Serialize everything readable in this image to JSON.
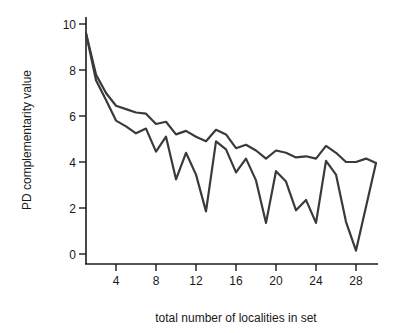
{
  "chart_data": {
    "type": "line",
    "title": "",
    "xlabel": "total number of localities in set",
    "ylabel": "PD complementarity value",
    "xlim": [
      0,
      30
    ],
    "ylim": [
      0,
      10
    ],
    "x_ticks": [
      4,
      8,
      12,
      16,
      20,
      24,
      28
    ],
    "y_ticks": [
      0,
      2,
      4,
      6,
      8,
      10
    ],
    "grid": false,
    "legend": null,
    "x": [
      1,
      2,
      3,
      4,
      5,
      6,
      7,
      8,
      9,
      10,
      11,
      12,
      13,
      14,
      15,
      16,
      17,
      18,
      19,
      20,
      21,
      22,
      23,
      24,
      25,
      26,
      27,
      28,
      29,
      30
    ],
    "series": [
      {
        "name": "upper",
        "color": "#3a3a3a",
        "values": [
          9.6,
          7.8,
          7.0,
          6.45,
          6.3,
          6.15,
          6.1,
          5.65,
          5.75,
          5.2,
          5.35,
          5.1,
          4.9,
          5.4,
          5.2,
          4.6,
          4.75,
          4.5,
          4.15,
          4.5,
          4.4,
          4.2,
          4.25,
          4.15,
          4.7,
          4.4,
          4.0,
          4.0,
          4.15,
          3.95
        ]
      },
      {
        "name": "lower",
        "color": "#3a3a3a",
        "values": [
          9.6,
          7.55,
          6.7,
          5.8,
          5.55,
          5.25,
          5.45,
          4.45,
          5.1,
          3.25,
          4.4,
          3.45,
          1.85,
          4.9,
          4.55,
          3.55,
          4.15,
          3.2,
          1.35,
          3.6,
          3.15,
          1.9,
          2.35,
          1.35,
          4.05,
          3.45,
          1.4,
          0.15,
          2.05,
          3.95
        ]
      }
    ]
  }
}
